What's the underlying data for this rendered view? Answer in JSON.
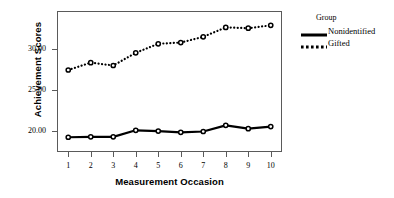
{
  "chart_data": {
    "type": "line",
    "title": "",
    "xlabel": "Measurement Occasion",
    "ylabel": "Achievement Scores",
    "x": [
      1,
      2,
      3,
      4,
      5,
      6,
      7,
      8,
      9,
      10
    ],
    "xtick_labels": [
      "1",
      "2",
      "3",
      "4",
      "5",
      "6",
      "7",
      "8",
      "9",
      "10"
    ],
    "ytick_labels": [
      "20.00",
      "25.00",
      "30.00"
    ],
    "ytick_values": [
      20.0,
      25.0,
      30.0
    ],
    "ylim": [
      17.4,
      34.6
    ],
    "xlim": [
      0.5,
      10.5
    ],
    "grid": false,
    "legend_position": "right",
    "legend_title": "Group",
    "series": [
      {
        "name": "Nonidentified",
        "style": "solid",
        "color": "#000000",
        "marker": "circle",
        "values": [
          19.2,
          19.25,
          19.25,
          20.05,
          19.95,
          19.8,
          19.9,
          20.65,
          20.25,
          20.5
        ]
      },
      {
        "name": "Gifted",
        "style": "dotted",
        "color": "#000000",
        "marker": "circle",
        "values": [
          27.4,
          28.3,
          27.95,
          29.5,
          30.6,
          30.75,
          31.45,
          32.6,
          32.5,
          32.85
        ]
      }
    ]
  }
}
